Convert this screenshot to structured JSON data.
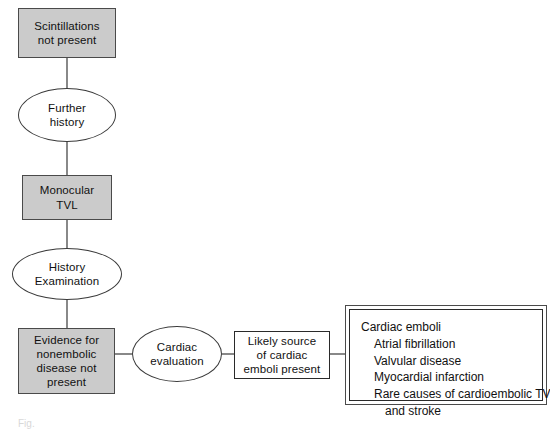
{
  "diagram": {
    "background_color": "#ffffff",
    "gray_fill": "#cbcbcb",
    "stroke_color": "#2a2a2a",
    "nodes": [
      {
        "id": "scintillations",
        "shape": "rect",
        "style": "gray",
        "label": "Scintillations\nnot present"
      },
      {
        "id": "further-history",
        "shape": "ellipse",
        "style": "plain",
        "label": "Further\nhistory"
      },
      {
        "id": "monocular-tvl",
        "shape": "rect",
        "style": "gray",
        "label": "Monocular\nTVL"
      },
      {
        "id": "history-examination",
        "shape": "ellipse",
        "style": "plain",
        "label": "History\nExamination"
      },
      {
        "id": "evidence-nonembolic",
        "shape": "rect",
        "style": "gray",
        "label": "Evidence for\nnonembolic\ndisease not\npresent"
      },
      {
        "id": "cardiac-evaluation",
        "shape": "ellipse",
        "style": "plain",
        "label": "Cardiac\nevaluation"
      },
      {
        "id": "likely-source",
        "shape": "rect",
        "style": "plain",
        "label": "Likely source\nof cardiac\nemboli present"
      }
    ],
    "outcome_box": {
      "id": "cardiac-emboli-list",
      "border": "double",
      "lines": [
        {
          "text": "Cardiac emboli",
          "indent": 0
        },
        {
          "text": "Atrial fibrillation",
          "indent": 1
        },
        {
          "text": "Valvular disease",
          "indent": 1
        },
        {
          "text": "Myocardial infarction",
          "indent": 1
        },
        {
          "text": "Rare causes of cardioembolic TVL",
          "indent": 1
        },
        {
          "text": "and stroke",
          "indent": 2
        }
      ]
    },
    "caption": "Fig."
  }
}
